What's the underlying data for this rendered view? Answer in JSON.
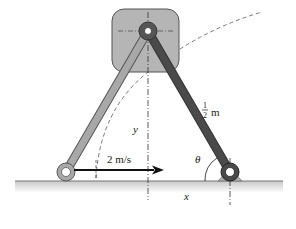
{
  "diagram": {
    "type": "mechanism",
    "labels": {
      "length": {
        "numerator": "1",
        "denominator": "2",
        "unit": "m"
      },
      "velocity": "2 m/s",
      "vertical_distance": "y",
      "horizontal_distance": "x",
      "angle": "θ"
    },
    "colors": {
      "block_fill": "#b5b5b5",
      "link_light": "#a8a8a8",
      "link_dark": "#4a4a4a",
      "ground": "#888888",
      "arrow": "#111111"
    },
    "components": [
      {
        "name": "sliding-block",
        "shape": "rounded-square"
      },
      {
        "name": "top-pivot"
      },
      {
        "name": "left-link",
        "color": "light"
      },
      {
        "name": "right-link",
        "color": "dark",
        "length": "1/2 m"
      },
      {
        "name": "left-collar"
      },
      {
        "name": "right-collar-pin-support"
      },
      {
        "name": "ground-surface"
      },
      {
        "name": "velocity-arrow",
        "value": "2 m/s",
        "direction": "right"
      },
      {
        "name": "dashed-arc-path"
      }
    ]
  }
}
